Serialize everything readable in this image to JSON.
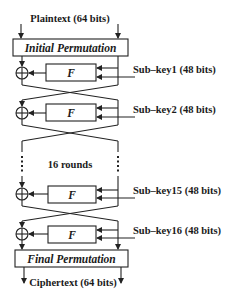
{
  "diagram": {
    "input_label": "Plaintext (64 bits)",
    "output_label": "Ciphertext (64 bits)",
    "initial_permutation": "Initial Permutation",
    "final_permutation": "Final Permutation",
    "function_label": "F",
    "rounds_label": "16 rounds",
    "xor_symbol": "+",
    "rounds": [
      {
        "round": 1,
        "subkey_label": "Sub–key1 (48 bits)"
      },
      {
        "round": 2,
        "subkey_label": "Sub–key2 (48 bits)"
      },
      {
        "round": 15,
        "subkey_label": "Sub–key15 (48 bits)"
      },
      {
        "round": 16,
        "subkey_label": "Sub–key16 (48 bits)"
      }
    ],
    "colors": {
      "stroke": "#222222",
      "text": "#1a1a1a",
      "background": "#ffffff"
    }
  }
}
